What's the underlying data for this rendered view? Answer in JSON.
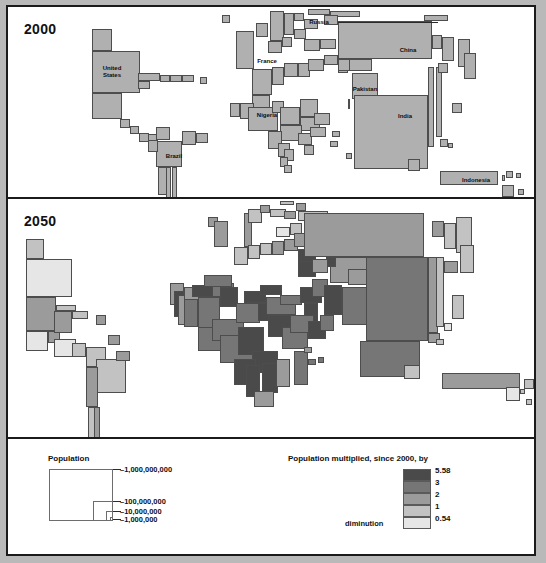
{
  "poster": {
    "panels": [
      {
        "id": "panel-2000",
        "year_label": "2000"
      },
      {
        "id": "panel-2050",
        "year_label": "2050"
      }
    ]
  },
  "map_2000": {
    "year": "2000",
    "fill": "#b0b0b0",
    "stroke": "#4d4d4d",
    "labels": [
      {
        "text": "United States",
        "lines": [
          "United",
          "States"
        ],
        "x": 104,
        "y": 58
      },
      {
        "text": "Brazil",
        "lines": [
          "Brazil"
        ],
        "x": 166,
        "y": 146
      },
      {
        "text": "France",
        "lines": [
          "France"
        ],
        "x": 259,
        "y": 51
      },
      {
        "text": "Russia",
        "lines": [
          "Russia"
        ],
        "x": 311,
        "y": 12
      },
      {
        "text": "Nigeria",
        "lines": [
          "Nigeria"
        ],
        "x": 259,
        "y": 105
      },
      {
        "text": "Pakistan",
        "lines": [
          "Pakistan"
        ],
        "x": 357,
        "y": 79
      },
      {
        "text": "China",
        "lines": [
          "China"
        ],
        "x": 400,
        "y": 40
      },
      {
        "text": "India",
        "lines": [
          "India"
        ],
        "x": 397,
        "y": 106
      },
      {
        "text": "Indonesia",
        "lines": [
          "Indonesia"
        ],
        "x": 468,
        "y": 170
      }
    ]
  },
  "map_2050": {
    "year": "2050"
  },
  "legend": {
    "population": {
      "title": "Population",
      "ticks": [
        {
          "label": "1,000,000,000",
          "display": "–1,000,000,000"
        },
        {
          "label": "100,000,000",
          "display": "–100,000,000"
        },
        {
          "label": "10,000,000",
          "display": "–10,000,000"
        },
        {
          "label": "1,000,000",
          "display": "–1,000,000"
        }
      ]
    },
    "multiplier": {
      "title": "Population multiplied, since 2000, by",
      "diminution_label": "diminution",
      "classes": [
        {
          "value": "5.58",
          "color": "#4a4a4a"
        },
        {
          "value": "3",
          "color": "#767676"
        },
        {
          "value": "2",
          "color": "#9b9b9b"
        },
        {
          "value": "1",
          "color": "#c2c2c2"
        },
        {
          "value": "0.54",
          "color": "#e6e6e6"
        }
      ]
    }
  },
  "chart_data": {
    "type": "map",
    "subtitle": "Area proportional to population; 2050 shaded by growth multiplier",
    "panels": [
      "2000",
      "2050"
    ],
    "legend_population_scale": [
      "1,000,000,000",
      "100,000,000",
      "10,000,000",
      "1,000,000"
    ],
    "legend_multiplier_breaks": [
      5.58,
      3,
      2,
      1,
      0.54
    ],
    "legend_multiplier_colors": [
      "#4a4a4a",
      "#767676",
      "#9b9b9b",
      "#c2c2c2",
      "#e6e6e6"
    ],
    "labelled_countries": [
      "United States",
      "Brazil",
      "France",
      "Russia",
      "Nigeria",
      "Pakistan",
      "China",
      "India",
      "Indonesia"
    ],
    "cells_2000": [
      [
        84,
        22,
        20,
        22
      ],
      [
        84,
        44,
        48,
        42
      ],
      [
        84,
        86,
        30,
        26
      ],
      [
        112,
        112,
        10,
        9
      ],
      [
        122,
        119,
        9,
        8
      ],
      [
        131,
        126,
        10,
        9
      ],
      [
        140,
        127,
        9,
        8
      ],
      [
        130,
        66,
        22,
        8
      ],
      [
        130,
        74,
        12,
        8
      ],
      [
        152,
        68,
        10,
        7
      ],
      [
        162,
        68,
        12,
        7
      ],
      [
        174,
        68,
        12,
        7
      ],
      [
        192,
        70,
        7,
        7
      ],
      [
        148,
        134,
        26,
        26
      ],
      [
        150,
        160,
        12,
        28
      ],
      [
        158,
        160,
        5,
        34
      ],
      [
        164,
        160,
        5,
        34
      ],
      [
        140,
        133,
        10,
        12
      ],
      [
        174,
        124,
        14,
        14
      ],
      [
        188,
        126,
        12,
        10
      ],
      [
        148,
        120,
        14,
        13
      ],
      [
        228,
        24,
        18,
        38
      ],
      [
        214,
        8,
        8,
        8
      ],
      [
        262,
        4,
        14,
        30
      ],
      [
        276,
        6,
        10,
        22
      ],
      [
        248,
        16,
        12,
        14
      ],
      [
        260,
        34,
        14,
        12
      ],
      [
        274,
        30,
        10,
        10
      ],
      [
        286,
        22,
        12,
        10
      ],
      [
        296,
        12,
        14,
        10
      ],
      [
        286,
        6,
        10,
        8
      ],
      [
        300,
        2,
        22,
        6
      ],
      [
        322,
        4,
        30,
        6
      ],
      [
        316,
        8,
        14,
        10
      ],
      [
        296,
        32,
        16,
        12
      ],
      [
        312,
        32,
        16,
        10
      ],
      [
        330,
        14,
        94,
        38
      ],
      [
        338,
        52,
        26,
        12
      ],
      [
        330,
        56,
        10,
        10
      ],
      [
        244,
        62,
        20,
        26
      ],
      [
        264,
        60,
        12,
        18
      ],
      [
        276,
        56,
        14,
        14
      ],
      [
        290,
        56,
        12,
        14
      ],
      [
        300,
        52,
        16,
        12
      ],
      [
        316,
        48,
        14,
        10
      ],
      [
        330,
        52,
        12,
        12
      ],
      [
        244,
        88,
        18,
        14
      ],
      [
        232,
        96,
        14,
        16
      ],
      [
        222,
        96,
        10,
        14
      ],
      [
        240,
        100,
        30,
        24
      ],
      [
        264,
        94,
        12,
        12
      ],
      [
        272,
        100,
        20,
        18
      ],
      [
        292,
        92,
        18,
        18
      ],
      [
        292,
        110,
        20,
        14
      ],
      [
        272,
        118,
        22,
        16
      ],
      [
        260,
        124,
        14,
        18
      ],
      [
        270,
        136,
        12,
        14
      ],
      [
        276,
        142,
        10,
        12
      ],
      [
        272,
        150,
        8,
        10
      ],
      [
        276,
        158,
        8,
        8
      ],
      [
        290,
        126,
        14,
        12
      ],
      [
        296,
        138,
        10,
        10
      ],
      [
        302,
        120,
        16,
        10
      ],
      [
        306,
        106,
        16,
        12
      ],
      [
        344,
        66,
        26,
        26
      ],
      [
        340,
        92,
        2,
        10
      ],
      [
        346,
        88,
        74,
        74
      ],
      [
        420,
        60,
        6,
        80
      ],
      [
        428,
        60,
        6,
        70
      ],
      [
        432,
        132,
        8,
        8
      ],
      [
        440,
        136,
        5,
        5
      ],
      [
        424,
        28,
        10,
        14
      ],
      [
        434,
        30,
        12,
        24
      ],
      [
        450,
        32,
        12,
        28
      ],
      [
        430,
        56,
        10,
        10
      ],
      [
        444,
        96,
        10,
        10
      ],
      [
        456,
        46,
        12,
        26
      ],
      [
        324,
        124,
        8,
        6
      ],
      [
        322,
        134,
        8,
        6
      ],
      [
        338,
        146,
        6,
        6
      ],
      [
        400,
        152,
        12,
        12
      ],
      [
        432,
        164,
        58,
        14
      ],
      [
        494,
        168,
        3,
        6
      ],
      [
        498,
        164,
        7,
        7
      ],
      [
        508,
        166,
        5,
        5
      ],
      [
        494,
        178,
        12,
        12
      ],
      [
        510,
        182,
        6,
        6
      ],
      [
        416,
        8,
        24,
        6
      ]
    ],
    "cells_2050": [
      [
        18,
        40,
        18,
        20
      ],
      [
        18,
        60,
        46,
        38
      ],
      [
        18,
        98,
        30,
        34
      ],
      [
        18,
        132,
        22,
        20
      ],
      [
        40,
        132,
        12,
        12
      ],
      [
        46,
        112,
        18,
        22
      ],
      [
        48,
        106,
        20,
        6
      ],
      [
        64,
        112,
        16,
        8
      ],
      [
        88,
        116,
        10,
        10
      ],
      [
        46,
        140,
        22,
        18
      ],
      [
        64,
        144,
        14,
        14
      ],
      [
        78,
        148,
        20,
        20
      ],
      [
        88,
        160,
        30,
        34
      ],
      [
        78,
        168,
        12,
        40
      ],
      [
        80,
        208,
        10,
        36
      ],
      [
        86,
        208,
        6,
        36
      ],
      [
        108,
        152,
        14,
        10
      ],
      [
        100,
        136,
        12,
        10
      ],
      [
        200,
        18,
        10,
        10
      ],
      [
        206,
        22,
        14,
        26
      ],
      [
        236,
        14,
        8,
        34
      ],
      [
        240,
        10,
        14,
        14
      ],
      [
        252,
        6,
        10,
        8
      ],
      [
        262,
        10,
        16,
        8
      ],
      [
        226,
        48,
        14,
        18
      ],
      [
        240,
        46,
        12,
        14
      ],
      [
        252,
        44,
        12,
        12
      ],
      [
        264,
        42,
        12,
        14
      ],
      [
        276,
        40,
        14,
        12
      ],
      [
        268,
        28,
        14,
        10
      ],
      [
        282,
        24,
        12,
        12
      ],
      [
        290,
        12,
        30,
        10
      ],
      [
        276,
        12,
        12,
        8
      ],
      [
        288,
        4,
        10,
        8
      ],
      [
        272,
        2,
        14,
        4
      ],
      [
        296,
        22,
        18,
        12
      ],
      [
        286,
        34,
        20,
        14
      ],
      [
        290,
        50,
        18,
        16
      ],
      [
        306,
        44,
        18,
        14
      ],
      [
        296,
        14,
        120,
        44
      ],
      [
        322,
        58,
        38,
        26
      ],
      [
        318,
        58,
        10,
        10
      ],
      [
        162,
        84,
        14,
        22
      ],
      [
        166,
        92,
        10,
        26
      ],
      [
        170,
        96,
        12,
        30
      ],
      [
        176,
        88,
        16,
        16
      ],
      [
        176,
        100,
        14,
        28
      ],
      [
        184,
        86,
        24,
        12
      ],
      [
        190,
        98,
        22,
        36
      ],
      [
        204,
        84,
        22,
        14
      ],
      [
        196,
        76,
        28,
        12
      ],
      [
        212,
        88,
        18,
        20
      ],
      [
        190,
        128,
        24,
        24
      ],
      [
        204,
        120,
        32,
        22
      ],
      [
        212,
        136,
        36,
        28
      ],
      [
        230,
        128,
        26,
        28
      ],
      [
        228,
        104,
        24,
        20
      ],
      [
        250,
        104,
        26,
        18
      ],
      [
        236,
        92,
        22,
        12
      ],
      [
        252,
        86,
        22,
        10
      ],
      [
        258,
        98,
        30,
        18
      ],
      [
        260,
        116,
        32,
        22
      ],
      [
        274,
        128,
        26,
        22
      ],
      [
        244,
        152,
        26,
        22
      ],
      [
        226,
        160,
        22,
        26
      ],
      [
        238,
        166,
        14,
        32
      ],
      [
        254,
        164,
        16,
        30
      ],
      [
        268,
        160,
        14,
        28
      ],
      [
        286,
        152,
        14,
        34
      ],
      [
        246,
        192,
        20,
        16
      ],
      [
        272,
        96,
        22,
        10
      ],
      [
        292,
        88,
        22,
        16
      ],
      [
        296,
        104,
        14,
        22
      ],
      [
        304,
        80,
        16,
        18
      ],
      [
        290,
        62,
        18,
        16
      ],
      [
        304,
        60,
        16,
        14
      ],
      [
        282,
        116,
        24,
        18
      ],
      [
        300,
        122,
        18,
        18
      ],
      [
        316,
        86,
        18,
        30
      ],
      [
        312,
        116,
        14,
        16
      ],
      [
        334,
        88,
        26,
        38
      ],
      [
        340,
        70,
        22,
        16
      ],
      [
        358,
        58,
        62,
        84
      ],
      [
        352,
        142,
        60,
        36
      ],
      [
        420,
        58,
        10,
        76
      ],
      [
        428,
        58,
        8,
        70
      ],
      [
        420,
        134,
        12,
        10
      ],
      [
        428,
        140,
        8,
        6
      ],
      [
        436,
        124,
        8,
        8
      ],
      [
        424,
        22,
        12,
        16
      ],
      [
        436,
        24,
        12,
        26
      ],
      [
        448,
        18,
        16,
        36
      ],
      [
        436,
        62,
        14,
        12
      ],
      [
        444,
        96,
        12,
        24
      ],
      [
        452,
        46,
        14,
        28
      ],
      [
        296,
        148,
        8,
        6
      ],
      [
        300,
        160,
        8,
        6
      ],
      [
        310,
        158,
        6,
        6
      ],
      [
        396,
        166,
        16,
        14
      ],
      [
        434,
        174,
        78,
        16
      ],
      [
        516,
        180,
        10,
        10
      ],
      [
        512,
        190,
        5,
        5
      ],
      [
        498,
        188,
        14,
        14
      ],
      [
        518,
        200,
        6,
        6
      ]
    ]
  }
}
